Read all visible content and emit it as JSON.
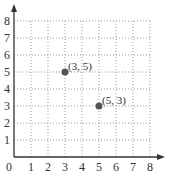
{
  "chart_data": {
    "type": "scatter",
    "title": "",
    "xlabel": "",
    "ylabel": "",
    "xlim": [
      0,
      8
    ],
    "ylim": [
      0,
      8
    ],
    "grid": true,
    "grid_style": "dotted",
    "x_ticks": [
      "0",
      "1",
      "2",
      "3",
      "4",
      "5",
      "6",
      "7",
      "8"
    ],
    "y_ticks": [
      "1",
      "2",
      "3",
      "4",
      "5",
      "6",
      "7",
      "8"
    ],
    "points": [
      {
        "x": 3,
        "y": 5,
        "label": "(3, 5)"
      },
      {
        "x": 5,
        "y": 3,
        "label": "(5, 3)"
      }
    ],
    "colors": {
      "axis": "#333333",
      "grid": "#9a9a9a",
      "point": "#555555",
      "text": "#333333"
    }
  }
}
